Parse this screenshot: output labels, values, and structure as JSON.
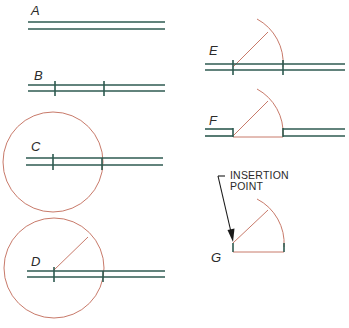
{
  "colors": {
    "wall": "#2e5a50",
    "arc": "#c87a6a",
    "text": "#2a2a2a",
    "arrow": "#1a1a1a"
  },
  "steps": [
    {
      "id": "A",
      "label": "A"
    },
    {
      "id": "B",
      "label": "B"
    },
    {
      "id": "C",
      "label": "C"
    },
    {
      "id": "D",
      "label": "D"
    },
    {
      "id": "E",
      "label": "E"
    },
    {
      "id": "F",
      "label": "F"
    },
    {
      "id": "G",
      "label": "G"
    }
  ],
  "annotation": {
    "line1": "INSERTION",
    "line2": "POINT"
  }
}
